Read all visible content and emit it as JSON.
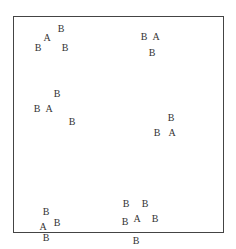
{
  "diagram": {
    "frame_color": "#444444",
    "label_color": "#333333",
    "points": [
      {
        "label": "B",
        "x": 61,
        "y": 29
      },
      {
        "label": "A",
        "x": 47,
        "y": 38
      },
      {
        "label": "B",
        "x": 38,
        "y": 48
      },
      {
        "label": "B",
        "x": 65,
        "y": 48
      },
      {
        "label": "B",
        "x": 144,
        "y": 37
      },
      {
        "label": "A",
        "x": 156,
        "y": 37
      },
      {
        "label": "B",
        "x": 152,
        "y": 53
      },
      {
        "label": "B",
        "x": 57,
        "y": 94
      },
      {
        "label": "B",
        "x": 37,
        "y": 109
      },
      {
        "label": "A",
        "x": 49,
        "y": 109
      },
      {
        "label": "B",
        "x": 72,
        "y": 122
      },
      {
        "label": "B",
        "x": 171,
        "y": 118
      },
      {
        "label": "B",
        "x": 157,
        "y": 133
      },
      {
        "label": "A",
        "x": 172,
        "y": 133
      },
      {
        "label": "B",
        "x": 46,
        "y": 212
      },
      {
        "label": "A",
        "x": 43,
        "y": 227
      },
      {
        "label": "B",
        "x": 57,
        "y": 223
      },
      {
        "label": "B",
        "x": 46,
        "y": 238
      },
      {
        "label": "B",
        "x": 126,
        "y": 204
      },
      {
        "label": "B",
        "x": 145,
        "y": 204
      },
      {
        "label": "B",
        "x": 125,
        "y": 222
      },
      {
        "label": "A",
        "x": 137,
        "y": 219
      },
      {
        "label": "B",
        "x": 155,
        "y": 219
      },
      {
        "label": "B",
        "x": 136,
        "y": 241
      }
    ]
  }
}
